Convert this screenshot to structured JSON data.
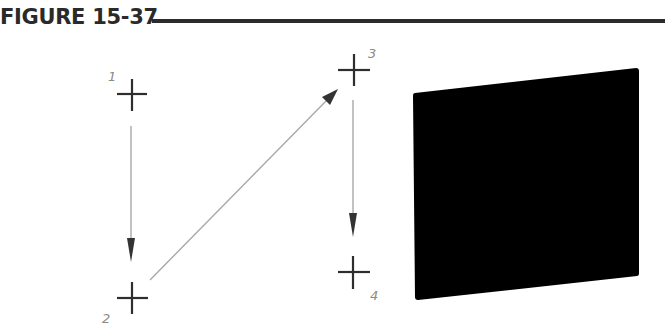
{
  "figure": {
    "title": "FIGURE 15-37"
  },
  "points": [
    {
      "label": "1",
      "x": 131,
      "y": 94
    },
    {
      "label": "2",
      "x": 131,
      "y": 298
    },
    {
      "label": "3",
      "x": 353,
      "y": 70
    },
    {
      "label": "4",
      "x": 353,
      "y": 272
    }
  ],
  "arrows": [
    {
      "from": "1",
      "to": "2"
    },
    {
      "from": "2",
      "to": "3"
    },
    {
      "from": "3",
      "to": "4"
    }
  ],
  "result_face": {
    "shape": "parallelogram",
    "fill": "#000000",
    "corners": [
      [
        413,
        92
      ],
      [
        639,
        68
      ],
      [
        639,
        276
      ],
      [
        415,
        300
      ]
    ]
  },
  "colors": {
    "crosshair": "#2e2e2e",
    "arrow_line": "#a8a8a8",
    "arrow_head": "#333333",
    "label": "#8a8a8a"
  }
}
